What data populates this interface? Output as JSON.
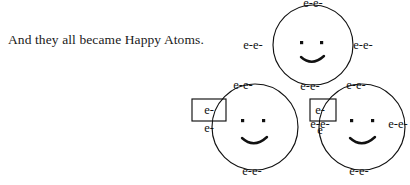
{
  "caption": {
    "text": "And they all became Happy Atoms."
  },
  "colors": {
    "ink": "#111111",
    "background": "#ffffff",
    "caption_text": "#1a1a1a"
  },
  "diagram": {
    "type": "three-bonded-happy-atoms",
    "electron_label": "e-",
    "pair_label": "e-e-",
    "atoms": [
      {
        "id": "atom-top",
        "cx": 313,
        "cy": 45,
        "r": 40,
        "face": {
          "eyes": [
            "left-eye",
            "right-eye"
          ],
          "mouth": "smile"
        },
        "electron_pairs": [
          {
            "name": "electron-pair-top",
            "label": "e-e-",
            "x": 313,
            "y": 3
          },
          {
            "name": "electron-pair-left",
            "label": "e-e-",
            "x": 248,
            "y": 45
          },
          {
            "name": "electron-pair-right",
            "label": "e-e-",
            "x": 360,
            "y": 45
          },
          {
            "name": "electron-pair-bottom",
            "label": "e-e-",
            "x": 313,
            "y": 86
          }
        ]
      },
      {
        "id": "atom-left",
        "cx": 255,
        "cy": 127,
        "r": 43,
        "face": {
          "eyes": [
            "left-eye",
            "right-eye"
          ],
          "mouth": "smile"
        },
        "electron_pairs": [
          {
            "name": "electron-pair-top",
            "label": "e-e-",
            "x": 243,
            "y": 85
          },
          {
            "name": "electron-pair-right",
            "label": "e-e-",
            "x": 318,
            "y": 124
          },
          {
            "name": "electron-pair-bottom",
            "label": "e-e-",
            "x": 250,
            "y": 171
          }
        ],
        "boxed_electrons": [
          {
            "name": "boxed-electron",
            "label": "e-",
            "x": 210,
            "y": 111
          }
        ],
        "loose_electrons": [
          {
            "name": "loose-electron",
            "label": "e-",
            "x": 210,
            "y": 128
          }
        ]
      },
      {
        "id": "atom-right",
        "cx": 362,
        "cy": 127,
        "r": 43,
        "face": {
          "eyes": [
            "left-eye",
            "right-eye"
          ],
          "mouth": "smile"
        },
        "electron_pairs": [
          {
            "name": "electron-pair-top",
            "label": "e-e-",
            "x": 354,
            "y": 85
          },
          {
            "name": "electron-pair-right",
            "label": "e-e-",
            "x": 396,
            "y": 124
          },
          {
            "name": "electron-pair-bottom",
            "label": "e-e-",
            "x": 357,
            "y": 171
          }
        ],
        "boxed_electrons": [
          {
            "name": "boxed-electron",
            "label": "e-",
            "x": 320,
            "y": 111
          }
        ],
        "loose_electrons": [
          {
            "name": "loose-electron",
            "label": "e",
            "x": 320,
            "y": 130
          }
        ]
      }
    ],
    "bond_boxes": [
      {
        "name": "bond-box-left",
        "x": 192,
        "y": 99,
        "w": 34,
        "h": 22
      },
      {
        "name": "bond-box-middle",
        "x": 310,
        "y": 99,
        "w": 26,
        "h": 22
      }
    ]
  }
}
